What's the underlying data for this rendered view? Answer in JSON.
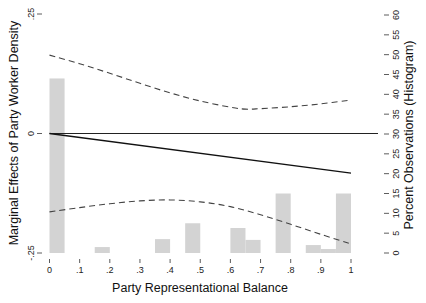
{
  "chart_data": {
    "type": "line",
    "title": "",
    "xlabel": "Party Representational Balance",
    "ylabel": "Marginal Effects of Party Worker Density",
    "y2label": "Percent Observations (Histogram)",
    "xlim": [
      0,
      1
    ],
    "ylim": [
      -0.25,
      0.25
    ],
    "y2lim": [
      0,
      60
    ],
    "grid": false,
    "legend": null,
    "x_ticks": [
      0,
      0.1,
      0.2,
      0.3,
      0.4,
      0.5,
      0.6,
      0.7,
      0.8,
      0.9,
      1
    ],
    "x_tick_labels": [
      "0",
      ".1",
      ".2",
      ".3",
      ".4",
      ".5",
      ".6",
      ".7",
      ".8",
      ".9",
      "1"
    ],
    "y_ticks": [
      -0.25,
      0,
      0.25
    ],
    "y_tick_labels": [
      "-.25",
      "0",
      ".25"
    ],
    "y2_ticks": [
      0,
      5,
      10,
      15,
      20,
      25,
      30,
      35,
      40,
      45,
      50,
      55,
      60
    ],
    "y2_tick_labels": [
      "0",
      "5",
      "10",
      "15",
      "20",
      "25",
      "30",
      "35",
      "40",
      "45",
      "50",
      "55",
      "60"
    ],
    "reference_line": {
      "y": 0,
      "style": "solid",
      "color": "#222222"
    },
    "series": [
      {
        "name": "Marginal effect",
        "style": "solid",
        "color": "#111111",
        "x": [
          0,
          1
        ],
        "y": [
          0,
          -0.083
        ]
      },
      {
        "name": "Upper 95% CI",
        "style": "dashed",
        "color": "#444444",
        "x": [
          0,
          0.1,
          0.2,
          0.3,
          0.4,
          0.5,
          0.6,
          0.65,
          0.7,
          0.8,
          0.9,
          1
        ],
        "y": [
          0.164,
          0.146,
          0.126,
          0.105,
          0.085,
          0.068,
          0.055,
          0.051,
          0.052,
          0.056,
          0.062,
          0.07
        ]
      },
      {
        "name": "Lower 95% CI",
        "style": "dashed",
        "color": "#444444",
        "x": [
          0,
          0.1,
          0.2,
          0.3,
          0.4,
          0.5,
          0.6,
          0.7,
          0.8,
          0.9,
          1
        ],
        "y": [
          -0.164,
          -0.155,
          -0.147,
          -0.141,
          -0.139,
          -0.143,
          -0.153,
          -0.17,
          -0.19,
          -0.211,
          -0.231
        ]
      }
    ],
    "histogram": {
      "axis": "y2",
      "color": "#d3d3d3",
      "bins": [
        {
          "x0": 0.0,
          "x1": 0.05,
          "percent": 44.0
        },
        {
          "x0": 0.15,
          "x1": 0.2,
          "percent": 1.5
        },
        {
          "x0": 0.35,
          "x1": 0.4,
          "percent": 3.5
        },
        {
          "x0": 0.45,
          "x1": 0.5,
          "percent": 7.5
        },
        {
          "x0": 0.6,
          "x1": 0.65,
          "percent": 6.3
        },
        {
          "x0": 0.65,
          "x1": 0.7,
          "percent": 3.3
        },
        {
          "x0": 0.75,
          "x1": 0.8,
          "percent": 15.0
        },
        {
          "x0": 0.85,
          "x1": 0.9,
          "percent": 2.0
        },
        {
          "x0": 0.9,
          "x1": 0.95,
          "percent": 1.0
        },
        {
          "x0": 0.95,
          "x1": 1.0,
          "percent": 15.0
        }
      ]
    }
  }
}
